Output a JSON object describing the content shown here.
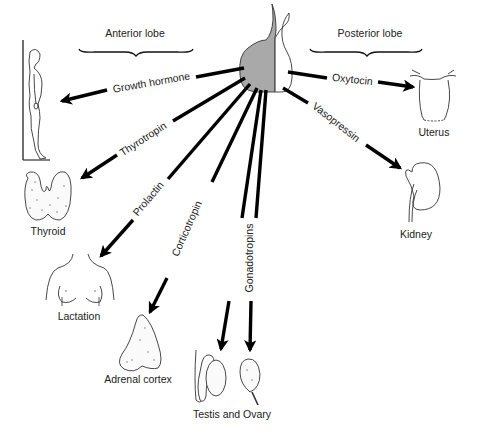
{
  "diagram": {
    "headings": {
      "anterior": "Anterior lobe",
      "posterior": "Posterior lobe"
    },
    "gland": {
      "anterior_color": "#a9a9a9",
      "posterior_color": "#ffffff"
    },
    "hormones": {
      "growth_hormone": "Growth hormone",
      "thyrotropin": "Thyrotropin",
      "prolactin": "Prolactin",
      "corticotropin": "Corticotropin",
      "gonadotropins": "Gonadotropins",
      "oxytocin": "Oxytocin",
      "vasopressin": "Vasopressin"
    },
    "targets": {
      "thyroid": "Thyroid",
      "lactation": "Lactation",
      "adrenal": "Adrenal cortex",
      "gonads": "Testis and Ovary",
      "uterus": "Uterus",
      "kidney": "Kidney"
    }
  }
}
